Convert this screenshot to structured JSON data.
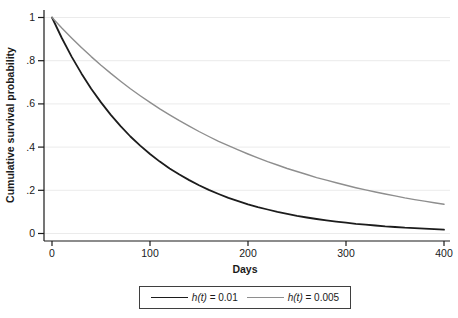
{
  "colors": {
    "background": "#ffffff",
    "axis": "#1a1a1a",
    "grid": "#ebebeb",
    "text": "#1a1a1a",
    "legend_border": "#3f3f3f"
  },
  "chart_data": {
    "type": "line",
    "title": "",
    "xlabel": "Days",
    "ylabel": "Cumulative survival probability",
    "xlim": [
      0,
      400
    ],
    "ylim": [
      0,
      1
    ],
    "grid": "horizontal-light",
    "legend_position": "bottom-center-boxed",
    "x_tick_values": [
      0,
      100,
      200,
      300,
      400
    ],
    "x_tick_labels": [
      "0",
      "100",
      "200",
      "300",
      "400"
    ],
    "y_tick_values": [
      0,
      0.2,
      0.4,
      0.6,
      0.8,
      1
    ],
    "y_tick_labels": [
      "0",
      ".2",
      ".4",
      ".6",
      ".8",
      "1"
    ],
    "x": [
      0,
      10,
      20,
      30,
      40,
      50,
      60,
      70,
      80,
      90,
      100,
      110,
      120,
      130,
      140,
      150,
      160,
      170,
      180,
      190,
      200,
      210,
      220,
      230,
      240,
      250,
      260,
      270,
      280,
      290,
      300,
      310,
      320,
      330,
      340,
      350,
      360,
      370,
      380,
      390,
      400
    ],
    "series": [
      {
        "name": "h(t) = 0.01",
        "func": "h(t)",
        "eq": " = 0.01",
        "color": "#1c1c1c",
        "width": 1.8,
        "values": [
          1,
          0.905,
          0.819,
          0.741,
          0.67,
          0.607,
          0.549,
          0.497,
          0.449,
          0.407,
          0.368,
          0.333,
          0.301,
          0.273,
          0.247,
          0.223,
          0.202,
          0.183,
          0.165,
          0.15,
          0.135,
          0.122,
          0.111,
          0.1,
          0.091,
          0.082,
          0.074,
          0.067,
          0.061,
          0.055,
          0.05,
          0.045,
          0.041,
          0.037,
          0.033,
          0.03,
          0.027,
          0.025,
          0.022,
          0.02,
          0.018
        ]
      },
      {
        "name": "h(t) = 0.005",
        "func": "h(t)",
        "eq": " = 0.005",
        "color": "#8e8e8e",
        "width": 1.4,
        "values": [
          1,
          0.951,
          0.905,
          0.861,
          0.819,
          0.779,
          0.741,
          0.705,
          0.67,
          0.638,
          0.607,
          0.577,
          0.549,
          0.522,
          0.497,
          0.472,
          0.449,
          0.427,
          0.407,
          0.387,
          0.368,
          0.35,
          0.333,
          0.317,
          0.301,
          0.287,
          0.273,
          0.259,
          0.247,
          0.235,
          0.223,
          0.212,
          0.202,
          0.192,
          0.183,
          0.174,
          0.165,
          0.157,
          0.15,
          0.142,
          0.135
        ]
      }
    ]
  }
}
